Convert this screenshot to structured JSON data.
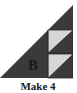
{
  "diagram": {
    "block_label": "B",
    "caption": "Make 4",
    "colors": {
      "dark": "#3a3a3a",
      "light": "#d6d6d6",
      "background": "#ffffff",
      "text": "#1a1a1a"
    },
    "units": [
      {
        "name": "half-square-triangle-top",
        "light": "upper-left",
        "dark": "lower-right"
      },
      {
        "name": "half-square-triangle-bottom",
        "light": "upper-left",
        "dark": "lower-right"
      }
    ]
  }
}
